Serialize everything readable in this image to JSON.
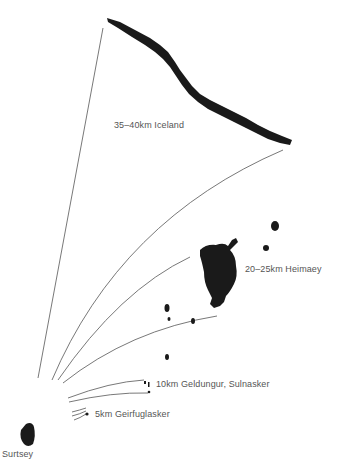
{
  "diagram": {
    "colors": {
      "land": "#1a1a1a",
      "line": "#555555",
      "text": "#555555",
      "background": "#ffffff"
    },
    "origin": {
      "name": "Surtsey",
      "label": "Surtsey"
    },
    "targets": [
      {
        "name": "Iceland",
        "distance": "35–40 km",
        "label": "35–40km  Iceland"
      },
      {
        "name": "Heimaey",
        "distance": "20–25 km",
        "label": "20–25km Heimaey"
      },
      {
        "name": "Geldungur, Sulnasker",
        "distance": "10 km",
        "label": "10km  Geldungur,  Sulnasker"
      },
      {
        "name": "Geirfuglasker",
        "distance": "5 km",
        "label": "5km Geirfuglasker"
      }
    ]
  }
}
